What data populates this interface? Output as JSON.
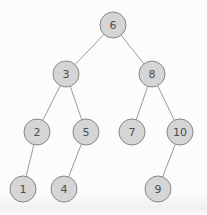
{
  "diagram": {
    "type": "binary-tree",
    "title": "",
    "background": "#fcfcfc",
    "node_style": {
      "radius": 13,
      "fill": "#d5d5d5",
      "stroke": "#878787",
      "stroke_width": 1,
      "text_color": "#4d4d4d"
    },
    "edge_style": {
      "color": "#9b9b9b",
      "width": 1
    },
    "nodes": [
      {
        "id": "6",
        "label": "6",
        "x": 113,
        "y": 25
      },
      {
        "id": "3",
        "label": "3",
        "x": 66,
        "y": 74
      },
      {
        "id": "8",
        "label": "8",
        "x": 152,
        "y": 74
      },
      {
        "id": "2",
        "label": "2",
        "x": 37,
        "y": 132
      },
      {
        "id": "5",
        "label": "5",
        "x": 86,
        "y": 132
      },
      {
        "id": "7",
        "label": "7",
        "x": 132,
        "y": 132
      },
      {
        "id": "10",
        "label": "10",
        "x": 180,
        "y": 132
      },
      {
        "id": "1",
        "label": "1",
        "x": 23,
        "y": 189
      },
      {
        "id": "4",
        "label": "4",
        "x": 64,
        "y": 189
      },
      {
        "id": "9",
        "label": "9",
        "x": 158,
        "y": 189
      }
    ],
    "edges": [
      {
        "from": "6",
        "to": "3",
        "side": "left"
      },
      {
        "from": "6",
        "to": "8",
        "side": "right"
      },
      {
        "from": "3",
        "to": "2",
        "side": "left"
      },
      {
        "from": "3",
        "to": "5",
        "side": "right"
      },
      {
        "from": "8",
        "to": "7",
        "side": "left"
      },
      {
        "from": "8",
        "to": "10",
        "side": "right"
      },
      {
        "from": "2",
        "to": "1",
        "side": "left"
      },
      {
        "from": "5",
        "to": "4",
        "side": "left"
      },
      {
        "from": "10",
        "to": "9",
        "side": "left"
      }
    ]
  }
}
